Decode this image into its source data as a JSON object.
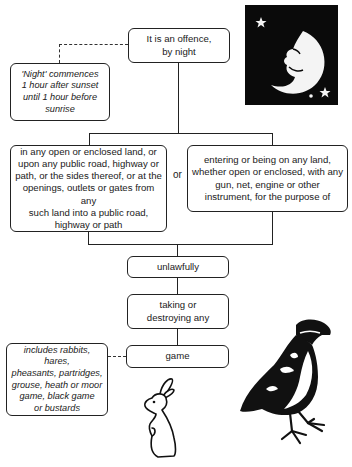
{
  "diagram": {
    "title_box": {
      "line1": "It is an offence,",
      "line2": "by night"
    },
    "night_note": {
      "lines": [
        "'Night' commences",
        "1 hour after sunset",
        "until 1 hour before",
        "sunrise"
      ]
    },
    "place_box": {
      "lines": [
        "in any open or enclosed land, or",
        "upon any public road, highway or",
        "path, or the sides thereof, or at the",
        "openings, outlets or gates from any",
        "such land into a public road,",
        "highway or path"
      ]
    },
    "or_label": "or",
    "entering_box": {
      "lines": [
        "entering or being on any land,",
        "whether open or enclosed, with any",
        "gun, net, engine or other",
        "instrument, for the purpose of"
      ]
    },
    "unlawfully_box": {
      "text": "unlawfully"
    },
    "taking_box": {
      "line1": "taking or",
      "line2": "destroying any"
    },
    "game_box": {
      "text": "game"
    },
    "game_note": {
      "lines": [
        "includes rabbits, hares,",
        "pheasants, partridges,",
        "grouse, heath or moor",
        "game, black game",
        "or bustards"
      ]
    },
    "illustrations": [
      "moon-with-stars",
      "rabbit",
      "game-bird"
    ]
  }
}
